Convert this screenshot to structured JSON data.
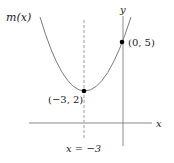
{
  "figure": {
    "function_label": "m(x)",
    "x_axis_label": "x",
    "y_axis_label": "y",
    "asymptote_label": "x = −3",
    "points": [
      {
        "label": "(−3, 2)",
        "x": -3,
        "y": 2,
        "role": "vertex"
      },
      {
        "label": "(0, 5)",
        "x": 0,
        "y": 5,
        "role": "y-intercept"
      }
    ],
    "axis_of_symmetry": "x = -3",
    "colors": {
      "curve": "#808080",
      "axis": "#888888",
      "dashed": "#aaaaaa",
      "point": "#000000"
    }
  }
}
